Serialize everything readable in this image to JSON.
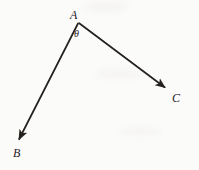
{
  "figure": {
    "kind": "geometry-angle-diagram",
    "width": 199,
    "height": 170,
    "background_color": "#fbfbfa",
    "stroke_color": "#24211f",
    "labels": {
      "vertex": "A",
      "ray1_end": "B",
      "ray2_end": "C",
      "angle": "θ"
    },
    "geometry": {
      "vertex_point": {
        "x": 78,
        "y": 23
      },
      "ray_to_B": {
        "from_x": 78,
        "from_y": 23,
        "to_x": 17,
        "to_y": 143
      },
      "ray_to_C": {
        "from_x": 79,
        "from_y": 23,
        "to_x": 168,
        "to_y": 90
      },
      "arrowheads": [
        "B",
        "C"
      ],
      "stroke_width": 1.6
    }
  }
}
